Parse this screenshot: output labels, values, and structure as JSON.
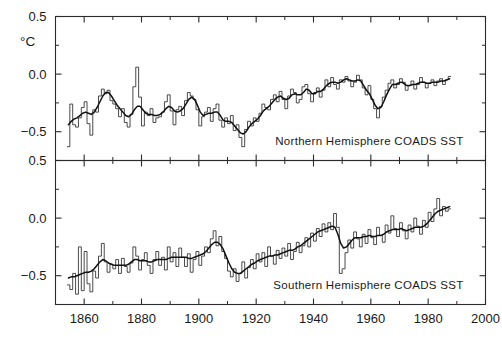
{
  "chart_data": {
    "type": "line",
    "title": "",
    "subtitle": "",
    "xlabel": "",
    "ylabel": "°C",
    "grid": false,
    "legend_position": "none",
    "xlim": [
      1850,
      2000
    ],
    "x_major_ticks": [
      1860,
      1880,
      1900,
      1920,
      1940,
      1960,
      1980,
      2000
    ],
    "x_minor_ticks": [
      1850,
      1870,
      1890,
      1910,
      1930,
      1950,
      1970,
      1990
    ],
    "x_tick_labels": [
      "1860",
      "1880",
      "1900",
      "1920",
      "1940",
      "1960",
      "1980",
      "2000"
    ],
    "panels": [
      {
        "name": "northern-hemisphere",
        "caption": "Northern  Hemisphere  COADS  SST",
        "ylim": [
          -0.75,
          0.5
        ],
        "y_major_ticks": [
          0.5,
          0.0,
          -0.5
        ],
        "y_tick_labels": [
          "0.5",
          "0.0",
          "-0.5"
        ],
        "y_minor_ticks": [
          0.25,
          -0.25
        ],
        "x_start": 1854,
        "series": [
          {
            "name": "annual anomaly",
            "style": "step",
            "values": [
              -0.63,
              -0.26,
              -0.44,
              -0.46,
              -0.38,
              -0.29,
              -0.24,
              -0.43,
              -0.53,
              -0.31,
              -0.33,
              -0.19,
              -0.13,
              -0.17,
              -0.14,
              -0.23,
              -0.26,
              -0.3,
              -0.37,
              -0.3,
              -0.42,
              -0.46,
              -0.35,
              -0.11,
              0.06,
              -0.2,
              -0.45,
              -0.33,
              -0.36,
              -0.3,
              -0.42,
              -0.38,
              -0.37,
              -0.33,
              -0.24,
              -0.18,
              -0.32,
              -0.44,
              -0.31,
              -0.28,
              -0.36,
              -0.23,
              -0.16,
              -0.19,
              -0.22,
              -0.31,
              -0.45,
              -0.37,
              -0.33,
              -0.29,
              -0.41,
              -0.3,
              -0.26,
              -0.4,
              -0.46,
              -0.38,
              -0.43,
              -0.36,
              -0.49,
              -0.44,
              -0.55,
              -0.63,
              -0.48,
              -0.41,
              -0.45,
              -0.38,
              -0.41,
              -0.34,
              -0.26,
              -0.29,
              -0.31,
              -0.22,
              -0.18,
              -0.24,
              -0.15,
              -0.22,
              -0.3,
              -0.19,
              -0.13,
              -0.16,
              -0.25,
              -0.22,
              -0.11,
              -0.09,
              -0.17,
              -0.24,
              -0.16,
              -0.12,
              -0.2,
              -0.14,
              -0.05,
              -0.11,
              -0.03,
              -0.09,
              -0.13,
              -0.05,
              -0.07,
              -0.02,
              -0.06,
              -0.11,
              -0.07,
              -0.01,
              -0.05,
              -0.12,
              -0.18,
              -0.1,
              -0.22,
              -0.3,
              -0.38,
              -0.28,
              -0.2,
              -0.14,
              -0.08,
              -0.05,
              -0.12,
              -0.09,
              -0.04,
              -0.07,
              -0.14,
              -0.1,
              -0.06,
              -0.13,
              -0.09,
              -0.03,
              -0.07,
              -0.12,
              -0.08,
              -0.05,
              -0.1,
              -0.06,
              -0.04,
              -0.09,
              -0.05,
              -0.02
            ]
          },
          {
            "name": "smoothed",
            "style": "smooth",
            "values": [
              -0.44,
              -0.41,
              -0.39,
              -0.38,
              -0.36,
              -0.34,
              -0.33,
              -0.34,
              -0.35,
              -0.33,
              -0.29,
              -0.24,
              -0.19,
              -0.16,
              -0.16,
              -0.19,
              -0.23,
              -0.27,
              -0.3,
              -0.33,
              -0.36,
              -0.37,
              -0.35,
              -0.31,
              -0.28,
              -0.28,
              -0.31,
              -0.34,
              -0.35,
              -0.35,
              -0.36,
              -0.36,
              -0.35,
              -0.33,
              -0.3,
              -0.28,
              -0.29,
              -0.32,
              -0.33,
              -0.32,
              -0.3,
              -0.26,
              -0.22,
              -0.2,
              -0.22,
              -0.27,
              -0.33,
              -0.36,
              -0.35,
              -0.34,
              -0.34,
              -0.33,
              -0.33,
              -0.36,
              -0.4,
              -0.41,
              -0.41,
              -0.42,
              -0.45,
              -0.48,
              -0.51,
              -0.52,
              -0.5,
              -0.46,
              -0.43,
              -0.41,
              -0.39,
              -0.36,
              -0.32,
              -0.3,
              -0.28,
              -0.25,
              -0.22,
              -0.2,
              -0.19,
              -0.21,
              -0.22,
              -0.21,
              -0.18,
              -0.17,
              -0.18,
              -0.18,
              -0.16,
              -0.13,
              -0.14,
              -0.17,
              -0.17,
              -0.15,
              -0.15,
              -0.13,
              -0.1,
              -0.08,
              -0.07,
              -0.07,
              -0.08,
              -0.07,
              -0.05,
              -0.04,
              -0.05,
              -0.06,
              -0.06,
              -0.05,
              -0.06,
              -0.1,
              -0.14,
              -0.17,
              -0.22,
              -0.27,
              -0.3,
              -0.29,
              -0.24,
              -0.18,
              -0.13,
              -0.09,
              -0.09,
              -0.08,
              -0.07,
              -0.08,
              -0.1,
              -0.1,
              -0.09,
              -0.09,
              -0.08,
              -0.07,
              -0.07,
              -0.08,
              -0.08,
              -0.07,
              -0.07,
              -0.07,
              -0.06,
              -0.06,
              -0.05,
              -0.04
            ]
          }
        ]
      },
      {
        "name": "southern-hemisphere",
        "caption": "Southern  Hemisphere  COADS  SST",
        "ylim": [
          -0.75,
          0.5
        ],
        "y_major_ticks": [
          0.5,
          0.0,
          -0.5
        ],
        "y_tick_labels": [
          "0.5",
          "0.0",
          "-0.5"
        ],
        "y_minor_ticks": [
          0.25,
          -0.25
        ],
        "x_start": 1854,
        "series": [
          {
            "name": "annual anomaly",
            "style": "step",
            "values": [
              -0.58,
              -0.62,
              -0.48,
              -0.66,
              -0.25,
              -0.63,
              -0.29,
              -0.57,
              -0.64,
              -0.46,
              -0.52,
              -0.33,
              -0.22,
              -0.38,
              -0.47,
              -0.4,
              -0.44,
              -0.36,
              -0.48,
              -0.35,
              -0.42,
              -0.47,
              -0.39,
              -0.25,
              -0.33,
              -0.45,
              -0.36,
              -0.3,
              -0.41,
              -0.48,
              -0.36,
              -0.29,
              -0.41,
              -0.34,
              -0.45,
              -0.25,
              -0.38,
              -0.3,
              -0.42,
              -0.26,
              -0.34,
              -0.42,
              -0.31,
              -0.47,
              -0.36,
              -0.29,
              -0.41,
              -0.33,
              -0.25,
              -0.3,
              -0.18,
              -0.11,
              -0.24,
              -0.16,
              -0.29,
              -0.35,
              -0.46,
              -0.51,
              -0.44,
              -0.55,
              -0.48,
              -0.38,
              -0.52,
              -0.43,
              -0.36,
              -0.44,
              -0.31,
              -0.38,
              -0.3,
              -0.42,
              -0.25,
              -0.33,
              -0.4,
              -0.28,
              -0.35,
              -0.26,
              -0.33,
              -0.22,
              -0.36,
              -0.29,
              -0.21,
              -0.3,
              -0.24,
              -0.17,
              -0.25,
              -0.13,
              -0.2,
              -0.09,
              -0.16,
              -0.05,
              -0.12,
              -0.04,
              -0.1,
              0.04,
              -0.08,
              -0.48,
              -0.44,
              -0.3,
              -0.19,
              -0.26,
              -0.12,
              -0.18,
              -0.25,
              -0.14,
              -0.22,
              -0.1,
              -0.17,
              -0.23,
              -0.08,
              -0.15,
              -0.21,
              -0.06,
              -0.13,
              0.02,
              -0.09,
              -0.16,
              -0.04,
              -0.11,
              -0.18,
              -0.06,
              -0.12,
              0.0,
              -0.07,
              -0.14,
              -0.02,
              -0.08,
              0.05,
              -0.03,
              0.08,
              0.17,
              0.02,
              0.1,
              0.06,
              0.08
            ]
          },
          {
            "name": "smoothed",
            "style": "smooth",
            "values": [
              -0.52,
              -0.51,
              -0.51,
              -0.5,
              -0.49,
              -0.48,
              -0.47,
              -0.47,
              -0.46,
              -0.44,
              -0.41,
              -0.38,
              -0.36,
              -0.37,
              -0.39,
              -0.4,
              -0.41,
              -0.41,
              -0.41,
              -0.41,
              -0.41,
              -0.4,
              -0.38,
              -0.36,
              -0.36,
              -0.37,
              -0.37,
              -0.37,
              -0.38,
              -0.38,
              -0.37,
              -0.36,
              -0.36,
              -0.36,
              -0.36,
              -0.35,
              -0.34,
              -0.34,
              -0.34,
              -0.34,
              -0.34,
              -0.34,
              -0.35,
              -0.35,
              -0.34,
              -0.33,
              -0.32,
              -0.31,
              -0.29,
              -0.26,
              -0.23,
              -0.21,
              -0.21,
              -0.23,
              -0.27,
              -0.33,
              -0.39,
              -0.44,
              -0.47,
              -0.48,
              -0.48,
              -0.46,
              -0.44,
              -0.42,
              -0.4,
              -0.39,
              -0.37,
              -0.36,
              -0.35,
              -0.34,
              -0.33,
              -0.33,
              -0.32,
              -0.32,
              -0.31,
              -0.3,
              -0.29,
              -0.28,
              -0.28,
              -0.27,
              -0.25,
              -0.24,
              -0.22,
              -0.2,
              -0.18,
              -0.16,
              -0.14,
              -0.12,
              -0.11,
              -0.1,
              -0.09,
              -0.08,
              -0.07,
              -0.08,
              -0.14,
              -0.22,
              -0.26,
              -0.25,
              -0.22,
              -0.19,
              -0.17,
              -0.17,
              -0.17,
              -0.16,
              -0.16,
              -0.15,
              -0.16,
              -0.16,
              -0.15,
              -0.15,
              -0.14,
              -0.12,
              -0.11,
              -0.1,
              -0.1,
              -0.1,
              -0.09,
              -0.1,
              -0.11,
              -0.1,
              -0.09,
              -0.08,
              -0.08,
              -0.08,
              -0.07,
              -0.05,
              -0.02,
              0.01,
              0.04,
              0.06,
              0.07,
              0.08,
              0.09,
              0.1
            ]
          }
        ]
      }
    ]
  }
}
